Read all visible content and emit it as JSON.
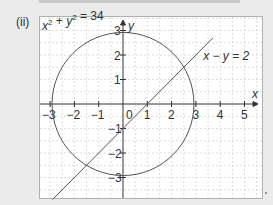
{
  "part_label": "(ii)",
  "chart_data": {
    "type": "line",
    "title": "",
    "xlabel": "x",
    "ylabel": "y",
    "xlim": [
      -3.5,
      5.8
    ],
    "ylim": [
      -3.9,
      3.5
    ],
    "grid": true,
    "x_ticks": [
      -3,
      -2,
      -1,
      0,
      1,
      2,
      3,
      4,
      5
    ],
    "y_ticks": [
      -3,
      -2,
      -1,
      1,
      2,
      3
    ],
    "series": [
      {
        "name": "x² + y² = 34",
        "kind": "circle",
        "center": [
          0,
          0
        ],
        "radius": 2.92
      },
      {
        "name": "x − y = 2",
        "kind": "line",
        "slope": 1,
        "intercept": -1,
        "x_range": [
          -2.9,
          3.7
        ]
      }
    ],
    "annotations": [
      {
        "text": "x² + y² = 34",
        "position": "top-left"
      },
      {
        "text": "x − y = 2",
        "position": "right of line"
      }
    ]
  },
  "labels": {
    "circle_eq": "x² + y² = 34",
    "line_eq": "x − y = 2",
    "x_axis": "x",
    "y_axis": "y",
    "origin": "0"
  }
}
